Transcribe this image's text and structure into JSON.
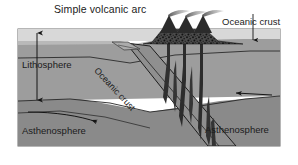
{
  "figure": {
    "type": "geologic-cross-section",
    "title": "Simple volcanic arc"
  },
  "labels": {
    "title": "Simple volcanic arc",
    "oceanic_crust_top": "Oceanic crust",
    "oceanic_crust_slab": "Oceanic crust",
    "lithosphere": "Lithosphere",
    "asthenosphere_left": "Asthenosphere",
    "asthenosphere_right": "Asthenosphere"
  },
  "colors": {
    "background": "#ffffff",
    "water": "#d8d8d8",
    "crust": "#b9b9b9",
    "lithosphere": "#9d9d9d",
    "asthenosphere": "#8a8a8a",
    "slab": "#8f8f8f",
    "volcano": "#3a3a3a",
    "magma": "#303030",
    "line": "#222222",
    "text": "#1b1b1b",
    "frame": "#6e6e6e"
  },
  "features": {
    "volcano_count": 3,
    "plume_count": 3,
    "magma_conduit_count": 6,
    "arrows": [
      {
        "name": "lithosphere-thickness-arrow",
        "direction": "vertical-double"
      },
      {
        "name": "asthenosphere-flow-arrow-left",
        "direction": "right"
      },
      {
        "name": "plate-motion-arrow-right",
        "direction": "left"
      },
      {
        "name": "oceanic-crust-pointer",
        "direction": "down"
      }
    ],
    "subduction_direction": "right-to-left, slab dips to lower-right"
  }
}
